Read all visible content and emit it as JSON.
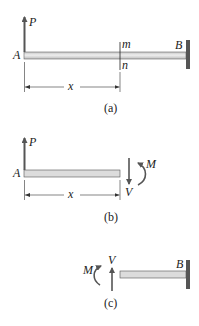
{
  "figure": {
    "panels": [
      {
        "id": "a",
        "caption": "(a)",
        "labels": {
          "force": "P",
          "left_end": "A",
          "section_top": "m",
          "section_bottom": "n",
          "right_end": "B",
          "distance": "x"
        }
      },
      {
        "id": "b",
        "caption": "(b)",
        "labels": {
          "force": "P",
          "left_end": "A",
          "shear": "V",
          "moment": "M",
          "distance": "x"
        }
      },
      {
        "id": "c",
        "caption": "(c)",
        "labels": {
          "moment": "M",
          "shear": "V",
          "right_end": "B"
        }
      }
    ],
    "colors": {
      "beam_fill": "#d9d9d9",
      "beam_stroke": "#555555",
      "arrow": "#555555",
      "wall": "#555555",
      "text": "#222222"
    }
  }
}
